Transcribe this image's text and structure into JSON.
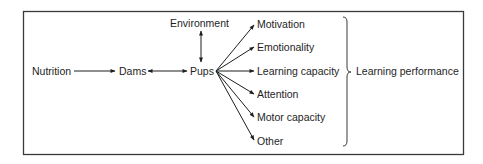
{
  "diagram": {
    "colors": {
      "frame": "#3a3a3a",
      "text": "#1e1e1e",
      "background": "#ffffff"
    },
    "nodes": {
      "nutrition": "Nutrition",
      "dams": "Dams",
      "pups": "Pups",
      "environment": "Environment",
      "outcomes": [
        "Motivation",
        "Emotionality",
        "Learning capacity",
        "Attention",
        "Motor capacity",
        "Other"
      ],
      "summary": "Learning performance"
    },
    "edges": [
      {
        "from": "Nutrition",
        "to": "Dams",
        "type": "one-way"
      },
      {
        "from": "Dams",
        "to": "Pups",
        "type": "two-way"
      },
      {
        "from": "Environment",
        "to": "Pups",
        "type": "two-way"
      },
      {
        "from": "Pups",
        "to": "Motivation",
        "type": "one-way"
      },
      {
        "from": "Pups",
        "to": "Emotionality",
        "type": "one-way"
      },
      {
        "from": "Pups",
        "to": "Learning capacity",
        "type": "one-way"
      },
      {
        "from": "Pups",
        "to": "Attention",
        "type": "one-way"
      },
      {
        "from": "Pups",
        "to": "Motor capacity",
        "type": "one-way"
      },
      {
        "from": "Pups",
        "to": "Other",
        "type": "one-way"
      }
    ],
    "grouping": {
      "members": [
        "Motivation",
        "Emotionality",
        "Learning capacity",
        "Attention",
        "Motor capacity",
        "Other"
      ],
      "label": "Learning performance",
      "symbol": "right-curly-brace"
    }
  }
}
